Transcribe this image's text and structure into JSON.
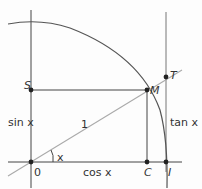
{
  "diagram": {
    "points": {
      "O": {
        "label": "0",
        "x": 31,
        "y": 162
      },
      "S": {
        "label": "S",
        "x": 31,
        "y": 90
      },
      "M": {
        "label": "M",
        "x": 147,
        "y": 90
      },
      "C": {
        "label": "C",
        "x": 147,
        "y": 162
      },
      "I": {
        "label": "I",
        "x": 166,
        "y": 162
      },
      "T": {
        "label": "T",
        "x": 166,
        "y": 77
      }
    },
    "labels": {
      "sin": "sin x",
      "cos": "cos x",
      "tan": "tan x",
      "radius": "1",
      "angle": "x"
    },
    "colors": {
      "axis": "#444444",
      "arc": "#555555",
      "ray": "#aaaaaa",
      "point": "#222222",
      "text": "#333333"
    }
  }
}
